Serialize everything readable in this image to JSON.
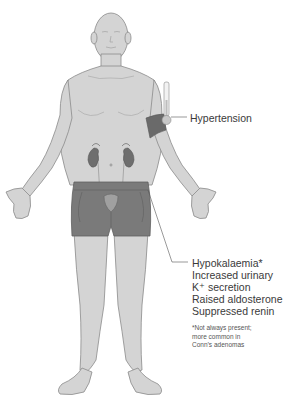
{
  "diagram": {
    "colors": {
      "skin": "#d4d4d4",
      "outline": "#8a8a8a",
      "shorts": "#7a7a7a",
      "kidney": "#6e6e6e",
      "cuff": "#6a6a6a",
      "text": "#3a3a3a"
    },
    "annotations": {
      "hypertension": {
        "label": "Hypertension",
        "icon": "thermometer-icon"
      },
      "findings": {
        "items": [
          "Hypokalaemia*",
          "Increased urinary",
          "K⁺ secretion",
          "Raised aldosterone",
          "Suppressed renin"
        ]
      },
      "footnote": {
        "lines": [
          "*Not always present;",
          "more common in",
          "Conn’s adenomas"
        ]
      }
    }
  }
}
